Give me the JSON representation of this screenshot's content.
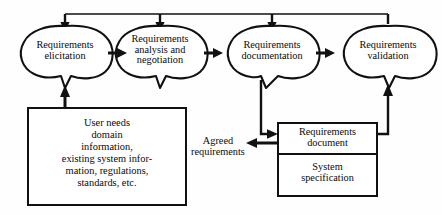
{
  "diagram": {
    "background_color": "#fefefe",
    "line_color": "#111111",
    "process_nodes": [
      {
        "id": "elicitation",
        "label": "Requirements\nelicitation"
      },
      {
        "id": "analysis",
        "label": "Requirements\nanalysis and\nnegotiation"
      },
      {
        "id": "documentation",
        "label": "Requirements\ndocumentation"
      },
      {
        "id": "validation",
        "label": "Requirements\nvalidation"
      }
    ],
    "input_box": {
      "id": "inputs",
      "label": "User needs\ndomain\ninformation,\nexisting system infor-\nmation, regulations,\nstandards, etc."
    },
    "output_box": {
      "id": "outputs",
      "sections": [
        {
          "id": "requirements-document",
          "label": "Requirements\ndocument"
        },
        {
          "id": "system-specification",
          "label": "System\nspecification"
        }
      ]
    },
    "agreed_label": {
      "id": "agreed-requirements",
      "label": "Agreed\nrequirements"
    },
    "connections": [
      {
        "from": "inputs",
        "to": "elicitation",
        "kind": "arrow-up"
      },
      {
        "from": "elicitation",
        "to": "analysis",
        "kind": "arrow-right"
      },
      {
        "from": "analysis",
        "to": "documentation",
        "kind": "arrow-right"
      },
      {
        "from": "documentation",
        "to": "validation",
        "kind": "arrow-right"
      },
      {
        "from": "documentation",
        "to": "outputs",
        "kind": "elbow-down-right"
      },
      {
        "from": "outputs",
        "to": "validation",
        "kind": "elbow-right-up"
      },
      {
        "from": "outputs",
        "to": "agreed-requirements",
        "kind": "arrow-left"
      },
      {
        "from": "validation",
        "to": "elicitation",
        "kind": "feedback-top"
      },
      {
        "from": "validation",
        "to": "analysis",
        "kind": "feedback-top"
      },
      {
        "from": "validation",
        "to": "documentation",
        "kind": "feedback-top"
      }
    ]
  }
}
